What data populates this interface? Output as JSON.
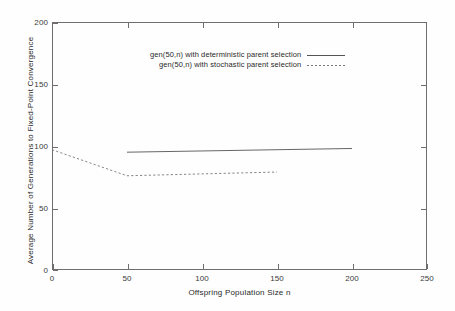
{
  "chart_data": {
    "type": "line",
    "title": "",
    "xlabel": "Offspring Population Size n",
    "ylabel": "Average Number of Generations to Fixed-Point Convergence",
    "xlim": [
      0,
      250
    ],
    "ylim": [
      0,
      200
    ],
    "xticks": [
      0,
      50,
      100,
      150,
      200,
      250
    ],
    "yticks": [
      0,
      50,
      100,
      150,
      200
    ],
    "xtick_labels": [
      "0",
      "50",
      "100",
      "150",
      "200",
      "250"
    ],
    "ytick_labels": [
      "0",
      "50",
      "100",
      "150",
      "200"
    ],
    "grid": false,
    "legend_position": "upper center",
    "series": [
      {
        "name": "gen(50,n) with deterministic parent selection",
        "style": "solid",
        "color": "#555555",
        "x": [
          50,
          200
        ],
        "y": [
          95,
          98
        ]
      },
      {
        "name": "gen(50,n) with stochastic parent selection",
        "style": "dashed",
        "color": "#777777",
        "x": [
          0,
          50,
          150
        ],
        "y": [
          97,
          76,
          79
        ]
      }
    ]
  },
  "axes": {
    "x_title": "Offspring Population Size n",
    "y_title": "Average Number of Generations to Fixed-Point Convergence"
  },
  "legend": {
    "entries": [
      {
        "label": "gen(50,n) with deterministic parent selection",
        "style": "solid"
      },
      {
        "label": "gen(50,n) with stochastic parent selection",
        "style": "dashed"
      }
    ]
  },
  "colors": {
    "axis": "#6e6e6e",
    "deterministic_line": "#555555",
    "stochastic_line": "#777777",
    "background": "#fefefe",
    "text": "#2a2a2a"
  }
}
